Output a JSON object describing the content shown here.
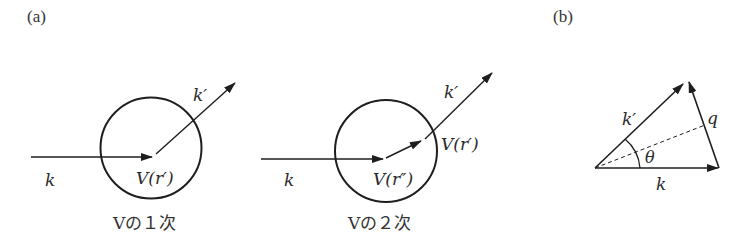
{
  "panels": {
    "a": {
      "label": "(a)",
      "first_order": {
        "incoming": "k",
        "outgoing": "k′",
        "potential": "V(r′)",
        "caption": "Vの１次"
      },
      "second_order": {
        "incoming": "k",
        "outgoing": "k′",
        "potential_first": "V(r″)",
        "potential_second": "V(r′)",
        "caption": "Vの２次"
      }
    },
    "b": {
      "label": "(b)",
      "vector_k": "k",
      "vector_k_prime": "k′",
      "vector_q": "q",
      "angle": "θ"
    }
  },
  "colors": {
    "stroke": "#1e1e1e",
    "text": "#2a2a2a",
    "background": "#ffffff"
  }
}
